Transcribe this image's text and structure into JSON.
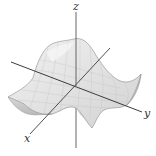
{
  "figure": {
    "axes": {
      "x": {
        "label": "x"
      },
      "y": {
        "label": "y"
      },
      "z": {
        "label": "z"
      }
    },
    "colors": {
      "surface_fill": "#e6e6e6",
      "surface_shade": "#cfcfcf",
      "surface_light": "#f4f4f4",
      "surface_edge": "#9a9a9a",
      "grid": "#c4c4c4",
      "axis": "#444444",
      "label": "#333333"
    }
  }
}
